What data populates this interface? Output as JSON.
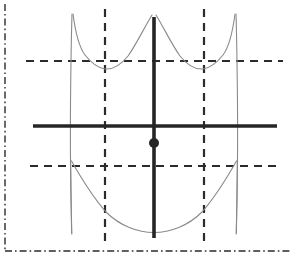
{
  "figure": {
    "background_color": "#ffffff",
    "width": 297,
    "height": 256,
    "frame": {
      "name": "plot-border",
      "color": "#2b2b2b",
      "stroke_width": 1.4,
      "dash_pattern": "7 3 1.6 3",
      "left_x": 5,
      "bottom_y": 251,
      "top_y": 4,
      "right_x": 292,
      "sides_drawn": [
        "left",
        "bottom"
      ]
    },
    "axes": {
      "color": "#262626",
      "stroke_width": 3.6,
      "origin_x": 154,
      "origin_y": 126,
      "x_axis": {
        "label": "x-axis",
        "x_start": 33,
        "x_end": 277,
        "y": 126
      },
      "y_axis": {
        "label": "y-axis",
        "y_start": 17,
        "y_end": 238,
        "x": 154
      }
    },
    "guides": {
      "color": "#2b2b2b",
      "stroke_width": 2.2,
      "dash_pattern": "8 6",
      "horizontal": [
        {
          "name": "upper-asymptote-guide",
          "y": 61,
          "x_start": 26,
          "x_end": 283
        },
        {
          "name": "lower-asymptote-guide",
          "y": 166,
          "x_start": 30,
          "x_end": 279
        }
      ],
      "vertical": [
        {
          "name": "left-asymptote-guide",
          "x": 105,
          "y_start": 9,
          "y_end": 245
        },
        {
          "name": "right-asymptote-guide",
          "x": 204,
          "y_start": 9,
          "y_end": 245
        }
      ]
    },
    "curve": {
      "color": "#8a8a8a",
      "stroke_width": 1.1,
      "branches": [
        {
          "name": "curve-branch-left-outer",
          "description": "steep descending branch near left edge",
          "path": "M 72,14 C 71.2,40 70.8,72 70.5,104 C 70.3,130 70.4,160 70.8,190 C 71.1,208 71.4,222 71.8,234"
        },
        {
          "name": "curve-branch-upper-left-well",
          "description": "upper-left U valley between left outer branch and center hump",
          "path": "M 73,14 C 75.5,33 79,47 85,55 C 92,64 99,68 105,69 C 112,69.6 120,66 128,56 C 136,45 144,28 152,15"
        },
        {
          "name": "curve-branch-upper-right-well",
          "description": "upper-right U valley mirrored about the y-axis",
          "path": "M 156,15 C 164,28 172,45 180,56 C 188,66 196,69.6 203,69 C 209,68 216,64 223,55 C 229,47 232.5,33 235,14"
        },
        {
          "name": "curve-branch-right-outer",
          "description": "steep descending branch near right edge",
          "path": "M 236,14 C 236.8,40 237.2,72 237.5,104 C 237.7,130 237.6,160 237.2,190 C 236.9,208 236.6,222 236.2,234"
        },
        {
          "name": "curve-branch-lower-bowl",
          "description": "wide lower U bowl with minimum on the y-axis",
          "path": "M 71.5,161 C 80,176 92,196 106,212 C 120,226 138,232.5 154,232.5 C 170,232.5 188,226 202,212 C 216,196 228,176 236.5,161"
        },
        {
          "name": "curve-branch-lower-left-tail",
          "description": "short tail continuing below the left guide crossing",
          "path": "M 70.6,160 C 70.9,190 71.2,214 71.6,233"
        },
        {
          "name": "curve-branch-lower-right-tail",
          "description": "short tail continuing below the right guide crossing",
          "path": "M 237.4,160 C 237.1,190 236.8,214 236.4,233"
        }
      ]
    },
    "point": {
      "name": "marked-point",
      "label": "plotted point on y-axis below origin",
      "x": 154,
      "y": 143,
      "radius": 5,
      "color": "#262626"
    }
  }
}
